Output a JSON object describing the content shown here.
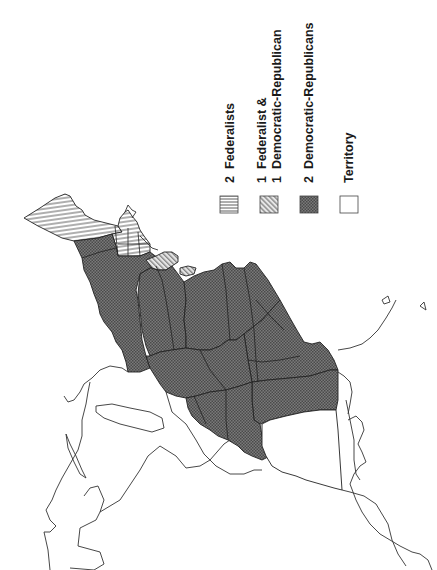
{
  "map": {
    "title": "",
    "orientation": "rotated-90-ccw",
    "legend": {
      "items": [
        {
          "id": "fed2",
          "count_line1": "2",
          "label_line1": "Federalists",
          "label_line2": "",
          "pattern": "horizontal-lines"
        },
        {
          "id": "mixed",
          "count_line1": "1",
          "label_line1": "Federalist &",
          "count_line2": "1",
          "label_line2": "Democratic-Republican",
          "pattern": "diagonal-lines"
        },
        {
          "id": "dr2",
          "count_line1": "2",
          "label_line1": "Democratic-Republicans",
          "label_line2": "",
          "pattern": "dark-crosshatch"
        },
        {
          "id": "territory",
          "count_line1": "",
          "label_line1": "Territory",
          "label_line2": "",
          "pattern": "none"
        }
      ]
    },
    "regions": [
      {
        "name": "northern-new-england",
        "category": "fed2"
      },
      {
        "name": "southern-new-england",
        "category": "fed2"
      },
      {
        "name": "delaware-maryland-area",
        "category": "mixed"
      },
      {
        "name": "new-york-area",
        "category": "dr2"
      },
      {
        "name": "pennsylvania-area",
        "category": "dr2"
      },
      {
        "name": "virginia-area",
        "category": "dr2"
      },
      {
        "name": "ohio-area",
        "category": "dr2"
      },
      {
        "name": "kentucky-area",
        "category": "dr2"
      },
      {
        "name": "tennessee-area",
        "category": "dr2"
      },
      {
        "name": "north-carolina-area",
        "category": "dr2"
      },
      {
        "name": "south-carolina-area",
        "category": "dr2"
      },
      {
        "name": "georgia-area",
        "category": "dr2"
      },
      {
        "name": "southern-territory",
        "category": "territory"
      }
    ],
    "colors": {
      "ink": "#222222",
      "dark_fill": "#6a6a6a",
      "hatch": "#333333",
      "background": "#ffffff"
    }
  }
}
